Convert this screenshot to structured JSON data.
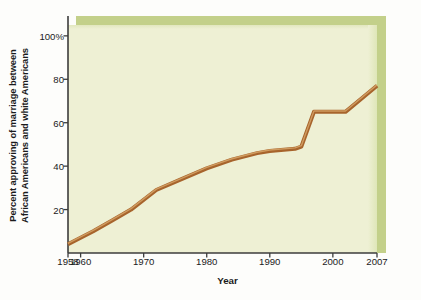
{
  "chart_data": {
    "type": "line",
    "title": "",
    "xlabel": "Year",
    "ylabel_lines": [
      "Percent approving of marriage between",
      "African Americans and white Americans"
    ],
    "ylabel": "Percent approving of marriage between African Americans and white Americans",
    "xlim": [
      1958,
      2007
    ],
    "ylim": [
      0,
      105
    ],
    "grid": false,
    "legend": null,
    "x_tick_labels": [
      "1958",
      "1960",
      "1970",
      "1980",
      "1990",
      "2000",
      "2007"
    ],
    "x_tick_values": [
      1958,
      1960,
      1970,
      1980,
      1990,
      2000,
      2007
    ],
    "y_tick_labels": [
      "20",
      "40",
      "60",
      "80",
      "100%"
    ],
    "y_tick_values": [
      20,
      40,
      60,
      80,
      100
    ],
    "series": [
      {
        "name": "Percent approving",
        "color": "#a7642c",
        "highlight_color": "#d6a469",
        "line_width": 4,
        "x": [
          1958,
          1962,
          1965,
          1968,
          1972,
          1976,
          1980,
          1984,
          1988,
          1990,
          1994,
          1995,
          1997,
          2002,
          2007
        ],
        "values": [
          4,
          10,
          15,
          20,
          29,
          34,
          39,
          43,
          46,
          47,
          48,
          49,
          65,
          65,
          77
        ]
      }
    ],
    "colors": {
      "panel_face": "#eef0d4",
      "panel_bevel": "#c3d08a",
      "line": "#a7642c",
      "line_highlight": "#d6a469",
      "axis": "#3c3c3c",
      "text": "#1b1b1b",
      "background": "#fdfdfb"
    },
    "annotations": []
  }
}
